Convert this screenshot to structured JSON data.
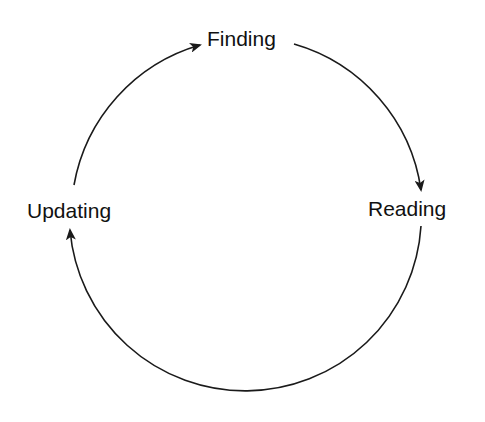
{
  "diagram": {
    "type": "cycle",
    "nodes": [
      {
        "id": "finding",
        "label": "Finding"
      },
      {
        "id": "reading",
        "label": "Reading"
      },
      {
        "id": "updating",
        "label": "Updating"
      }
    ],
    "edges": [
      {
        "from": "finding",
        "to": "reading"
      },
      {
        "from": "reading",
        "to": "updating"
      },
      {
        "from": "updating",
        "to": "finding"
      }
    ],
    "colors": {
      "stroke": "#1a1a1a",
      "text": "#111111",
      "background": "#ffffff"
    }
  }
}
